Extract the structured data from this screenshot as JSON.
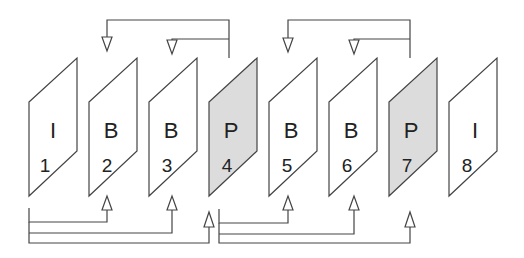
{
  "diagram": {
    "title": "",
    "colors": {
      "line": "#444444",
      "frame_fill": "#ffffff",
      "p_frame_fill": "#dcdcdc",
      "text": "#222222"
    },
    "frames": [
      {
        "type": "I",
        "number": "1",
        "shaded": false
      },
      {
        "type": "B",
        "number": "2",
        "shaded": false
      },
      {
        "type": "B",
        "number": "3",
        "shaded": false
      },
      {
        "type": "P",
        "number": "4",
        "shaded": true
      },
      {
        "type": "B",
        "number": "5",
        "shaded": false
      },
      {
        "type": "B",
        "number": "6",
        "shaded": false
      },
      {
        "type": "P",
        "number": "7",
        "shaded": true
      },
      {
        "type": "I",
        "number": "8",
        "shaded": false
      }
    ],
    "references": [
      {
        "from": "4",
        "to": "2",
        "route": "top"
      },
      {
        "from": "4",
        "to": "3",
        "route": "top"
      },
      {
        "from": "7",
        "to": "5",
        "route": "top"
      },
      {
        "from": "7",
        "to": "6",
        "route": "top"
      },
      {
        "from": "1",
        "to": "2",
        "route": "bottom"
      },
      {
        "from": "1",
        "to": "3",
        "route": "bottom"
      },
      {
        "from": "1",
        "to": "4",
        "route": "bottom"
      },
      {
        "from": "4",
        "to": "5",
        "route": "bottom"
      },
      {
        "from": "4",
        "to": "6",
        "route": "bottom"
      },
      {
        "from": "4",
        "to": "7",
        "route": "bottom"
      }
    ]
  }
}
